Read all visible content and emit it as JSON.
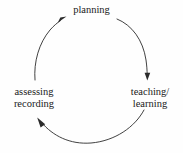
{
  "diagram": {
    "type": "cycle",
    "direction": "clockwise",
    "background_color": "#fefefe",
    "line_color": "#2b2b2b",
    "text_color": "#1a1a1a",
    "nodes": [
      {
        "id": "planning",
        "position": "top",
        "lines": [
          "planning"
        ]
      },
      {
        "id": "teaching-learning",
        "position": "right",
        "lines": [
          "teaching/",
          "learning"
        ]
      },
      {
        "id": "assessing-recording",
        "position": "left",
        "lines": [
          "assessing",
          "recording"
        ]
      }
    ],
    "arrows": [
      {
        "from": "planning",
        "to": "teaching-learning",
        "side": "right"
      },
      {
        "from": "teaching-learning",
        "to": "assessing-recording",
        "side": "bottom"
      },
      {
        "from": "assessing-recording",
        "to": "planning",
        "side": "left"
      }
    ]
  }
}
